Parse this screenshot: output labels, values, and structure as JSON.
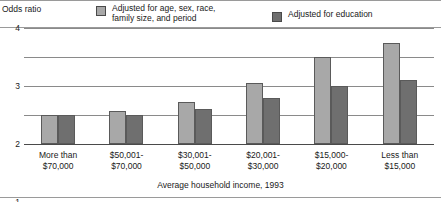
{
  "legend": {
    "entries": [
      {
        "label": "Adjusted for age, sex, race,\nfamily size, and period",
        "swatch": "light-gray-swatch",
        "color": "#a8a8a8"
      },
      {
        "label": "Adjusted for education",
        "swatch": "dark-gray-swatch",
        "color": "#6f6f6f"
      }
    ]
  },
  "axes": {
    "ytitle": "Odds ratio",
    "xtitle": "Average household income, 1993",
    "yticks": [
      "4",
      "3",
      "2",
      "1",
      "0"
    ]
  },
  "chart_data": {
    "type": "bar",
    "title": "",
    "ylabel": "Odds ratio",
    "xlabel": "Average household income, 1993",
    "ylim": [
      0,
      4
    ],
    "yticks": [
      0,
      1,
      2,
      3,
      4
    ],
    "grid": true,
    "legend_position": "top",
    "categories": [
      "More than\n$70,000",
      "$50,001-\n$70,000",
      "$30,001-\n$50,000",
      "$20,001-\n$30,000",
      "$15,000-\n$20,000",
      "Less than\n$15,000"
    ],
    "series": [
      {
        "name": "Adjusted for age, sex, race, family size, and period",
        "color": "#a8a8a8",
        "values": [
          1.0,
          1.15,
          1.45,
          2.1,
          3.0,
          3.5
        ]
      },
      {
        "name": "Adjusted for education",
        "color": "#6f6f6f",
        "values": [
          1.0,
          1.0,
          1.2,
          1.6,
          2.0,
          2.2
        ]
      }
    ]
  }
}
